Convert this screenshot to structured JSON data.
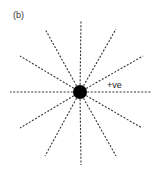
{
  "figure": {
    "panel_label": "(b)",
    "charge_label": "+ve",
    "charge": {
      "type": "positive point charge",
      "cx": 80,
      "cy": 92,
      "r": 7,
      "color": "#000000"
    },
    "field_lines": {
      "style": "dashed",
      "color": "#333333",
      "count": 12,
      "endpoints": [
        {
          "x": 81,
          "y": 20
        },
        {
          "x": 116,
          "y": 29
        },
        {
          "x": 143,
          "y": 56
        },
        {
          "x": 152,
          "y": 92
        },
        {
          "x": 142,
          "y": 128
        },
        {
          "x": 116,
          "y": 156
        },
        {
          "x": 81,
          "y": 165
        },
        {
          "x": 45,
          "y": 156
        },
        {
          "x": 20,
          "y": 128
        },
        {
          "x": 10,
          "y": 92
        },
        {
          "x": 20,
          "y": 56
        },
        {
          "x": 45,
          "y": 29
        }
      ]
    }
  }
}
